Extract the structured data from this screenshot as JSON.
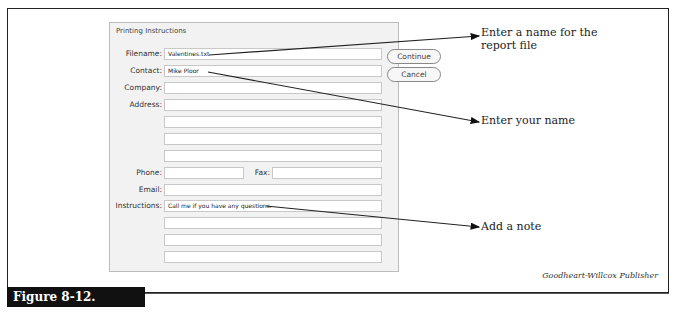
{
  "figure": {
    "label": "Figure 8-12.",
    "credit": "Goodheart-Willcox Publisher"
  },
  "dialog": {
    "title": "Printing Instructions",
    "fields": {
      "filename": {
        "label": "Filename:",
        "value": "Valentines.txt"
      },
      "contact": {
        "label": "Contact:",
        "value": "Mike Ploor"
      },
      "company": {
        "label": "Company:",
        "value": ""
      },
      "address": {
        "label": "Address:",
        "lines": [
          "",
          "",
          "",
          ""
        ]
      },
      "phone": {
        "label": "Phone:",
        "value": ""
      },
      "fax": {
        "label": "Fax:",
        "value": ""
      },
      "email": {
        "label": "Email:",
        "value": ""
      },
      "instructions": {
        "label": "Instructions:",
        "lines": [
          "Call me if you have any questions.",
          "",
          "",
          ""
        ]
      }
    },
    "buttons": {
      "continue": "Continue",
      "cancel": "Cancel"
    }
  },
  "callouts": {
    "filename": "Enter a name for the report file",
    "contact": "Enter your name",
    "instructions": "Add a note"
  }
}
